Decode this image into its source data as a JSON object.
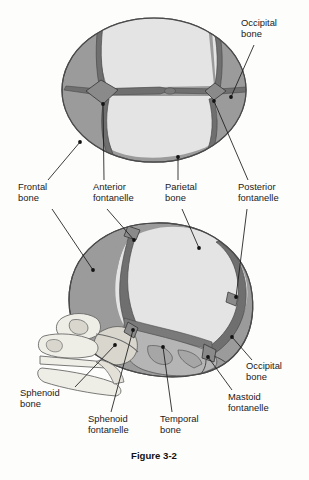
{
  "figure": {
    "caption": "Figure 3-2",
    "title_alt": "Fetal skull: superior view and lateral view showing bones, sutures, and fontanelles"
  },
  "colors": {
    "page_background": "#fdfdfc",
    "bone_dark": "#9b9b9b",
    "bone_light": "#e4e4e4",
    "bone_mid": "#b5b5b5",
    "bone_pale": "#efeee6",
    "suture_dark": "#5a5a5a",
    "fontanelle_fill": "#8f8f8f",
    "outline": "#4a4a4a",
    "leader_line": "#1a1a1a",
    "label_text": "#1b1b1b"
  },
  "superior_view": {
    "name": "superior-view-skull",
    "bones": [
      {
        "id": "frontal",
        "label": "Frontal bone",
        "shade": "bone_dark"
      },
      {
        "id": "parietal-left",
        "label": "Parietal bone",
        "shade": "bone_light"
      },
      {
        "id": "parietal-right",
        "label": "Parietal bone",
        "shade": "bone_light"
      },
      {
        "id": "occipital",
        "label": "Occipital bone",
        "shade": "bone_dark"
      }
    ],
    "fontanelles": [
      {
        "id": "anterior",
        "label": "Anterior fontanelle"
      },
      {
        "id": "posterior",
        "label": "Posterior fontanelle"
      }
    ]
  },
  "lateral_view": {
    "name": "lateral-view-skull",
    "bones": [
      {
        "id": "frontal",
        "label": "Frontal bone",
        "shade": "bone_dark"
      },
      {
        "id": "parietal",
        "label": "Parietal bone",
        "shade": "bone_light"
      },
      {
        "id": "occipital",
        "label": "Occipital bone",
        "shade": "bone_dark"
      },
      {
        "id": "temporal",
        "label": "Temporal bone",
        "shade": "bone_mid"
      },
      {
        "id": "sphenoid",
        "label": "Sphenoid bone",
        "shade": "bone_pale"
      }
    ],
    "fontanelles": [
      {
        "id": "sphenoid",
        "label": "Sphenoid fontanelle"
      },
      {
        "id": "mastoid",
        "label": "Mastoid fontanelle"
      },
      {
        "id": "anterior",
        "label": "Anterior fontanelle"
      },
      {
        "id": "posterior",
        "label": "Posterior fontanelle"
      }
    ]
  },
  "labels": [
    {
      "id": "occipital-bone-top",
      "line1": "Occipital",
      "line2": "bone",
      "x": 241,
      "y": 26,
      "anchor": "start"
    },
    {
      "id": "frontal-bone",
      "line1": "Frontal",
      "line2": "bone",
      "x": 18,
      "y": 190,
      "anchor": "start"
    },
    {
      "id": "anterior-fontanelle",
      "line1": "Anterior",
      "line2": "fontanelle",
      "x": 93,
      "y": 190,
      "anchor": "start"
    },
    {
      "id": "parietal-bone",
      "line1": "Parietal",
      "line2": "bone",
      "x": 165,
      "y": 190,
      "anchor": "start"
    },
    {
      "id": "posterior-fontanelle",
      "line1": "Posterior",
      "line2": "fontanelle",
      "x": 238,
      "y": 190,
      "anchor": "start"
    },
    {
      "id": "occipital-bone-bottom",
      "line1": "Occipital",
      "line2": "bone",
      "x": 246,
      "y": 369,
      "anchor": "start"
    },
    {
      "id": "sphenoid-bone",
      "line1": "Sphenoid",
      "line2": "bone",
      "x": 20,
      "y": 396,
      "anchor": "start"
    },
    {
      "id": "mastoid-fontanelle",
      "line1": "Mastoid",
      "line2": "fontanelle",
      "x": 228,
      "y": 400,
      "anchor": "start"
    },
    {
      "id": "sphenoid-fontanelle",
      "line1": "Sphenoid",
      "line2": "fontanelle",
      "x": 88,
      "y": 422,
      "anchor": "start"
    },
    {
      "id": "temporal-bone",
      "line1": "Temporal",
      "line2": "bone",
      "x": 160,
      "y": 422,
      "anchor": "start"
    }
  ]
}
